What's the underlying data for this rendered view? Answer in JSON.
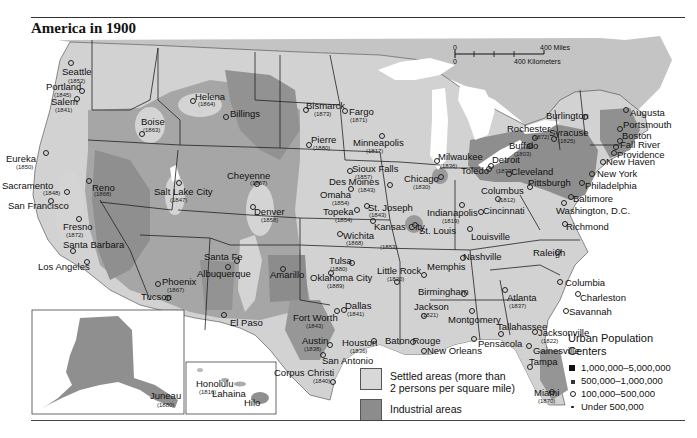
{
  "title": "America in 1900",
  "colors": {
    "background_land": "#c9c9c9",
    "settled": "#dcdcdc",
    "industrial": "#8e8e8e",
    "unsettled": "#a8a8a8",
    "water": "#ffffff",
    "border": "#222222"
  },
  "scale_bar": {
    "zero_miles": "0",
    "miles_label": "400 Miles",
    "zero_km": "0",
    "km_label": "400 Kilometers"
  },
  "legend_areas": [
    {
      "name": "settled",
      "label_line1": "Settled areas (more than",
      "label_line2": "2 persons per square mile)",
      "color": "#d8d8d8"
    },
    {
      "name": "industrial",
      "label_line1": "Industrial areas",
      "label_line2": "",
      "color": "#8c8c8c"
    }
  ],
  "legend_urban": {
    "heading_line1": "Urban Population",
    "heading_line2": "Centers",
    "items": [
      {
        "symbol": "large-square",
        "label": "1,000,000–5,000,000"
      },
      {
        "symbol": "small-square",
        "label": "500,000–1,000,000"
      },
      {
        "symbol": "open-circle",
        "label": "100,000–500,000"
      },
      {
        "symbol": "dot",
        "label": "Under 500,000"
      }
    ]
  },
  "insets": [
    {
      "name": "alaska",
      "cities": [
        {
          "name": "Juneau",
          "year": "(1880)"
        }
      ]
    },
    {
      "name": "hawaii",
      "cities": [
        {
          "name": "Honolulu",
          "year": "(1816)"
        },
        {
          "name": "Lahaina",
          "year": ""
        },
        {
          "name": "Hilo",
          "year": ""
        }
      ]
    }
  ],
  "cities": [
    {
      "name": "Seattle",
      "year": "(1852)",
      "x": 62,
      "y": 67,
      "yx": 68,
      "yy": 78,
      "px": 70,
      "py": 62
    },
    {
      "name": "Portland",
      "year": "(1845)",
      "x": 46,
      "y": 82,
      "yx": 54,
      "yy": 92,
      "px": 81,
      "py": 90
    },
    {
      "name": "Salem",
      "year": "(1841)",
      "x": 51,
      "y": 97,
      "yx": 55,
      "yy": 107,
      "px": 76,
      "py": 98
    },
    {
      "name": "Helena",
      "year": "(1864)",
      "x": 195,
      "y": 92,
      "yx": 198,
      "yy": 101,
      "px": 192,
      "py": 100
    },
    {
      "name": "Billings",
      "year": "",
      "x": 230,
      "y": 109,
      "yx": 0,
      "yy": 0,
      "px": 225,
      "py": 116
    },
    {
      "name": "Boise",
      "year": "(1863)",
      "x": 141,
      "y": 117,
      "yx": 143,
      "yy": 127,
      "px": 141,
      "py": 133
    },
    {
      "name": "Bismarck",
      "year": "(1873)",
      "x": 306,
      "y": 101,
      "yx": 314,
      "yy": 111,
      "px": 305,
      "py": 109
    },
    {
      "name": "Fargo",
      "year": "(1871)",
      "x": 349,
      "y": 107,
      "yx": 350,
      "yy": 117,
      "px": 344,
      "py": 110
    },
    {
      "name": "Minneapolis",
      "year": "(1817)",
      "x": 353,
      "y": 138,
      "yx": 366,
      "yy": 148,
      "px": 381,
      "py": 135
    },
    {
      "name": "Pierre",
      "year": "(1880)",
      "x": 311,
      "y": 135,
      "yx": 313,
      "yy": 145,
      "px": 308,
      "py": 144
    },
    {
      "name": "Eureka",
      "year": "(1850)",
      "x": 6,
      "y": 154,
      "yx": 16,
      "yy": 164,
      "px": 45,
      "py": 152
    },
    {
      "name": "Sacramento",
      "year": "(1848)",
      "x": 2,
      "y": 181,
      "yx": 43,
      "yy": 190,
      "px": 66,
      "py": 191
    },
    {
      "name": "Reno",
      "year": "(1868)",
      "x": 92,
      "y": 183,
      "yx": 94,
      "yy": 191,
      "px": 88,
      "py": 180
    },
    {
      "name": "San Francisco",
      "year": "",
      "x": 8,
      "y": 201,
      "yx": 0,
      "yy": 0,
      "px": 50,
      "py": 200
    },
    {
      "name": "Salt Lake City",
      "year": "(1847)",
      "x": 154,
      "y": 187,
      "yx": 170,
      "yy": 197,
      "px": 178,
      "py": 182
    },
    {
      "name": "Cheyenne",
      "year": "(1867)",
      "x": 227,
      "y": 171,
      "yx": 250,
      "yy": 180,
      "px": 256,
      "py": 183
    },
    {
      "name": "Sioux Falls",
      "year": "(1857)",
      "x": 352,
      "y": 164,
      "yx": 355,
      "yy": 174,
      "px": 349,
      "py": 170
    },
    {
      "name": "Des Moines",
      "year": "(1843)",
      "x": 329,
      "y": 177,
      "yx": 358,
      "yy": 187,
      "px": 389,
      "py": 184
    },
    {
      "name": "Omaha",
      "year": "(1854)",
      "x": 320,
      "y": 190,
      "yx": 332,
      "yy": 200,
      "px": 350,
      "py": 188
    },
    {
      "name": "Milwaukee",
      "year": "(1836)",
      "x": 438,
      "y": 152,
      "yx": 440,
      "yy": 163,
      "px": 436,
      "py": 160
    },
    {
      "name": "Detroit",
      "year": "",
      "x": 492,
      "y": 155,
      "yx": 0,
      "yy": 0,
      "px": 490,
      "py": 165
    },
    {
      "name": "Toledo",
      "year": "(1833)",
      "x": 461,
      "y": 166,
      "yx": 496,
      "yy": 168,
      "px": 488,
      "py": 168
    },
    {
      "name": "Chicago",
      "year": "(1830)",
      "x": 404,
      "y": 174,
      "yx": 413,
      "yy": 184,
      "px": 440,
      "py": 176
    },
    {
      "name": "Cleveland",
      "year": "",
      "x": 511,
      "y": 167,
      "yx": 0,
      "yy": 0,
      "px": 508,
      "py": 173
    },
    {
      "name": "Pittsburgh",
      "year": "",
      "x": 528,
      "y": 178,
      "yx": 0,
      "yy": 0,
      "px": 529,
      "py": 186
    },
    {
      "name": "Columbus",
      "year": "(1812)",
      "x": 481,
      "y": 186,
      "yx": 498,
      "yy": 197,
      "px": 497,
      "py": 198
    },
    {
      "name": "Indianapolis",
      "year": "(1819)",
      "x": 427,
      "y": 208,
      "yx": 442,
      "yy": 218,
      "px": 461,
      "py": 204
    },
    {
      "name": "Cincinnati",
      "year": "",
      "x": 483,
      "y": 206,
      "yx": 0,
      "yy": 0,
      "px": 480,
      "py": 211
    },
    {
      "name": "Kansas City",
      "year": "(1853)",
      "x": 374,
      "y": 222,
      "yx": 380,
      "yy": 244,
      "px": 372,
      "py": 220
    },
    {
      "name": "St. Joseph",
      "year": "(1843)",
      "x": 368,
      "y": 203,
      "yx": 369,
      "yy": 212,
      "px": 366,
      "py": 205
    },
    {
      "name": "Topeka",
      "year": "(1854)",
      "x": 323,
      "y": 207,
      "yx": 335,
      "yy": 217,
      "px": 356,
      "py": 209
    },
    {
      "name": "Wichita",
      "year": "(1868)",
      "x": 343,
      "y": 231,
      "yx": 346,
      "yy": 240,
      "px": 339,
      "py": 233
    },
    {
      "name": "Denver",
      "year": "(1858)",
      "x": 254,
      "y": 207,
      "yx": 261,
      "yy": 217,
      "px": 252,
      "py": 206
    },
    {
      "name": "St. Louis",
      "year": "",
      "x": 419,
      "y": 226,
      "yx": 0,
      "yy": 0,
      "px": 414,
      "py": 224
    },
    {
      "name": "Louisville",
      "year": "",
      "x": 471,
      "y": 232,
      "yx": 0,
      "yy": 0,
      "px": 469,
      "py": 228
    },
    {
      "name": "Santa Fe",
      "year": "",
      "x": 204,
      "y": 252,
      "yx": 0,
      "yy": 0,
      "px": 236,
      "py": 260
    },
    {
      "name": "Albuquerque",
      "year": "",
      "x": 197,
      "y": 269,
      "yx": 0,
      "yy": 0,
      "px": 227,
      "py": 266
    },
    {
      "name": "Amarillo",
      "year": "",
      "x": 270,
      "y": 270,
      "yx": 0,
      "yy": 0,
      "px": 282,
      "py": 268
    },
    {
      "name": "Fresno",
      "year": "(1872)",
      "x": 63,
      "y": 222,
      "yx": 66,
      "yy": 232,
      "px": 78,
      "py": 218
    },
    {
      "name": "Santa Barbara",
      "year": "",
      "x": 63,
      "y": 240,
      "yx": 0,
      "yy": 0,
      "px": 72,
      "py": 250
    },
    {
      "name": "Los Angeles",
      "year": "",
      "x": 38,
      "y": 262,
      "yx": 0,
      "yy": 0,
      "px": 86,
      "py": 261
    },
    {
      "name": "Phoenix",
      "year": "(1867)",
      "x": 162,
      "y": 277,
      "yx": 167,
      "yy": 287,
      "px": 157,
      "py": 283
    },
    {
      "name": "Tucson",
      "year": "",
      "x": 141,
      "y": 292,
      "yx": 0,
      "yy": 0,
      "px": 167,
      "py": 297
    },
    {
      "name": "Tulsa",
      "year": "(1880)",
      "x": 329,
      "y": 256,
      "yx": 330,
      "yy": 266,
      "px": 351,
      "py": 262
    },
    {
      "name": "Oklahoma City",
      "year": "(1889)",
      "x": 310,
      "y": 273,
      "yx": 327,
      "yy": 283,
      "px": 330,
      "py": 272
    },
    {
      "name": "Little Rock",
      "year": "(1820)",
      "x": 377,
      "y": 266,
      "yx": 387,
      "yy": 276,
      "px": 396,
      "py": 281
    },
    {
      "name": "Memphis",
      "year": "",
      "x": 427,
      "y": 262,
      "yx": 0,
      "yy": 0,
      "px": 423,
      "py": 274
    },
    {
      "name": "Nashville",
      "year": "",
      "x": 463,
      "y": 252,
      "yx": 0,
      "yy": 0,
      "px": 462,
      "py": 257
    },
    {
      "name": "Raleigh",
      "year": "",
      "x": 533,
      "y": 248,
      "yx": 0,
      "yy": 0,
      "px": 557,
      "py": 251
    },
    {
      "name": "Richmond",
      "year": "",
      "x": 566,
      "y": 222,
      "yx": 0,
      "yy": 0,
      "px": 564,
      "py": 223
    },
    {
      "name": "Washington, D.C.",
      "year": "",
      "x": 556,
      "y": 206,
      "yx": 0,
      "yy": 0,
      "px": 563,
      "py": 202
    },
    {
      "name": "Baltimore",
      "year": "",
      "x": 573,
      "y": 194,
      "yx": 0,
      "yy": 0,
      "px": 570,
      "py": 196
    },
    {
      "name": "Philadelphia",
      "year": "",
      "x": 585,
      "y": 181,
      "yx": 0,
      "yy": 0,
      "px": 581,
      "py": 182
    },
    {
      "name": "New York",
      "year": "",
      "x": 597,
      "y": 169,
      "yx": 0,
      "yy": 0,
      "px": 591,
      "py": 173
    },
    {
      "name": "New Haven",
      "year": "",
      "x": 606,
      "y": 157,
      "yx": 0,
      "yy": 0,
      "px": 602,
      "py": 161
    },
    {
      "name": "Providence",
      "year": "",
      "x": 617,
      "y": 150,
      "yx": 0,
      "yy": 0,
      "px": 613,
      "py": 152
    },
    {
      "name": "Fall River",
      "year": "",
      "x": 620,
      "y": 140,
      "yx": 0,
      "yy": 0,
      "px": 615,
      "py": 146
    },
    {
      "name": "Boston",
      "year": "",
      "x": 622,
      "y": 131,
      "yx": 0,
      "yy": 0,
      "px": 619,
      "py": 140
    },
    {
      "name": "Portsmouth",
      "year": "",
      "x": 623,
      "y": 120,
      "yx": 0,
      "yy": 0,
      "px": 619,
      "py": 128
    },
    {
      "name": "Augusta",
      "year": "",
      "x": 630,
      "y": 108,
      "yx": 0,
      "yy": 0,
      "px": 625,
      "py": 109
    },
    {
      "name": "Burlington",
      "year": "",
      "x": 546,
      "y": 111,
      "yx": 0,
      "yy": 0,
      "px": 584,
      "py": 116
    },
    {
      "name": "Rochester",
      "year": "(1872)",
      "x": 507,
      "y": 124,
      "yx": 532,
      "yy": 134,
      "px": 534,
      "py": 137
    },
    {
      "name": "Syracuse",
      "year": "(1825)",
      "x": 549,
      "y": 128,
      "yx": 558,
      "yy": 138,
      "px": 553,
      "py": 138
    },
    {
      "name": "Buffalo",
      "year": "(1803)",
      "x": 509,
      "y": 141,
      "yx": 514,
      "yy": 151,
      "px": 529,
      "py": 145
    },
    {
      "name": "Columbia",
      "year": "",
      "x": 565,
      "y": 278,
      "yx": 0,
      "yy": 0,
      "px": 559,
      "py": 281
    },
    {
      "name": "Charleston",
      "year": "",
      "x": 580,
      "y": 293,
      "yx": 0,
      "yy": 0,
      "px": 577,
      "py": 293
    },
    {
      "name": "Savannah",
      "year": "",
      "x": 569,
      "y": 307,
      "yx": 0,
      "yy": 0,
      "px": 565,
      "py": 310
    },
    {
      "name": "Atlanta",
      "year": "(1837)",
      "x": 507,
      "y": 293,
      "yx": 509,
      "yy": 303,
      "px": 504,
      "py": 289
    },
    {
      "name": "Birmingham",
      "year": "",
      "x": 418,
      "y": 287,
      "yx": 0,
      "yy": 0,
      "px": 463,
      "py": 293
    },
    {
      "name": "Jackson",
      "year": "(1821)",
      "x": 414,
      "y": 302,
      "yx": 421,
      "yy": 312,
      "px": 423,
      "py": 315
    },
    {
      "name": "Montgomery",
      "year": "",
      "x": 448,
      "y": 315,
      "yx": 0,
      "yy": 0,
      "px": 471,
      "py": 310
    },
    {
      "name": "Tallahassee",
      "year": "",
      "x": 497,
      "y": 322,
      "yx": 0,
      "yy": 0,
      "px": 500,
      "py": 333
    },
    {
      "name": "Jacksonville",
      "year": "(1822)",
      "x": 538,
      "y": 328,
      "yx": 541,
      "yy": 338,
      "px": 534,
      "py": 331
    },
    {
      "name": "Gainesville",
      "year": "",
      "x": 533,
      "y": 346,
      "yx": 0,
      "yy": 0,
      "px": 528,
      "py": 345
    },
    {
      "name": "Pensacola",
      "year": "",
      "x": 478,
      "y": 339,
      "yx": 0,
      "yy": 0,
      "px": 473,
      "py": 338
    },
    {
      "name": "Tampa",
      "year": "",
      "x": 529,
      "y": 357,
      "yx": 0,
      "yy": 0,
      "px": 529,
      "py": 366
    },
    {
      "name": "Miami",
      "year": "(1870)",
      "x": 534,
      "y": 388,
      "yx": 538,
      "yy": 398,
      "px": 551,
      "py": 391
    },
    {
      "name": "Dallas",
      "year": "(1841)",
      "x": 345,
      "y": 301,
      "yx": 347,
      "yy": 311,
      "px": 343,
      "py": 309
    },
    {
      "name": "Fort Worth",
      "year": "(1843)",
      "x": 293,
      "y": 313,
      "yx": 306,
      "yy": 323,
      "px": 336,
      "py": 310
    },
    {
      "name": "Austin",
      "year": "(1838)",
      "x": 302,
      "y": 336,
      "yx": 304,
      "yy": 346,
      "px": 329,
      "py": 344
    },
    {
      "name": "Houston",
      "year": "(1836)",
      "x": 342,
      "y": 338,
      "yx": 350,
      "yy": 348,
      "px": 373,
      "py": 340
    },
    {
      "name": "San Antonio",
      "year": "",
      "x": 322,
      "y": 356,
      "yx": 0,
      "yy": 0,
      "px": 322,
      "py": 354
    },
    {
      "name": "Baton Rouge",
      "year": "",
      "x": 385,
      "y": 336,
      "yx": 0,
      "yy": 0,
      "px": 412,
      "py": 341
    },
    {
      "name": "New Orleans",
      "year": "",
      "x": 427,
      "y": 346,
      "yx": 0,
      "yy": 0,
      "px": 423,
      "py": 350
    },
    {
      "name": "Corpus Christi",
      "year": "(1840)",
      "x": 274,
      "y": 368,
      "yx": 313,
      "yy": 378,
      "px": 332,
      "py": 381
    },
    {
      "name": "El Paso",
      "year": "",
      "x": 230,
      "y": 318,
      "yx": 0,
      "yy": 0,
      "px": 223,
      "py": 314
    }
  ]
}
